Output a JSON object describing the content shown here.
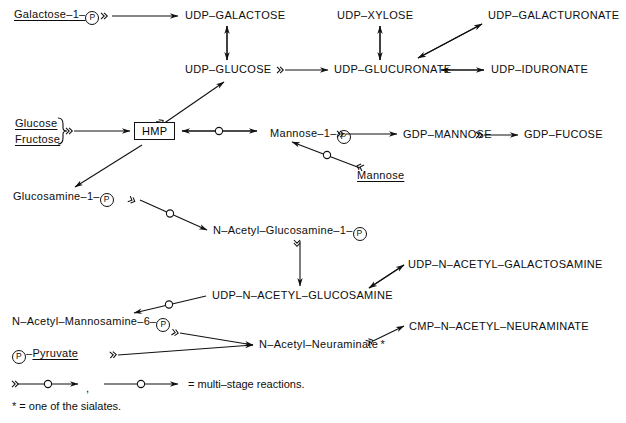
{
  "figure": {
    "type": "biochemical-pathway-diagram"
  },
  "nodes": [
    {
      "id": "galactose-1-p",
      "label": "Galactose–1–",
      "suffix_p": true,
      "underline": true,
      "x": 14,
      "y": 9
    },
    {
      "id": "udp-galactose",
      "label": "UDP–GALACTOSE",
      "suffix_p": false,
      "underline": false,
      "x": 185,
      "y": 10
    },
    {
      "id": "udp-xylose",
      "label": "UDP–XYLOSE",
      "suffix_p": false,
      "underline": false,
      "x": 337,
      "y": 10
    },
    {
      "id": "udp-galacturonate",
      "label": "UDP–GALACTURONATE",
      "suffix_p": false,
      "underline": false,
      "x": 488,
      "y": 10
    },
    {
      "id": "udp-glucose",
      "label": "UDP–GLUCOSE",
      "suffix_p": false,
      "underline": false,
      "x": 185,
      "y": 64
    },
    {
      "id": "udp-glucuronate",
      "label": "UDP–GLUCURONATE",
      "suffix_p": false,
      "underline": false,
      "x": 334,
      "y": 64
    },
    {
      "id": "udp-iduronate",
      "label": "UDP–IDURONATE",
      "suffix_p": false,
      "underline": false,
      "x": 491,
      "y": 64
    },
    {
      "id": "glucose",
      "label": "Glucose",
      "suffix_p": false,
      "underline": true,
      "x": 15,
      "y": 120
    },
    {
      "id": "fructose",
      "label": "Fructose",
      "suffix_p": false,
      "underline": true,
      "x": 15,
      "y": 135
    },
    {
      "id": "mannose-1-p",
      "label": "Mannose–1–",
      "suffix_p": true,
      "underline": false,
      "x": 270,
      "y": 128
    },
    {
      "id": "gdp-mannose",
      "label": "GDP–MANNOSE",
      "suffix_p": false,
      "underline": false,
      "x": 403,
      "y": 129
    },
    {
      "id": "gdp-fucose",
      "label": "GDP–FUCOSE",
      "suffix_p": false,
      "underline": false,
      "x": 524,
      "y": 129
    },
    {
      "id": "mannose",
      "label": "Mannose",
      "suffix_p": false,
      "underline": true,
      "x": 357,
      "y": 170
    },
    {
      "id": "glucosamine-1-p",
      "label": "Glucosamine–1–",
      "suffix_p": true,
      "underline": false,
      "x": 13,
      "y": 191
    },
    {
      "id": "n-acetyl-glucosamine-1-p",
      "label": "N–Acetyl–Glucosamine–1–",
      "suffix_p": true,
      "underline": false,
      "x": 213,
      "y": 225
    },
    {
      "id": "udp-n-acetyl-galactosamine",
      "label": "UDP–N–ACETYL–GALACTOSAMINE",
      "suffix_p": false,
      "underline": false,
      "x": 408,
      "y": 259
    },
    {
      "id": "udp-n-acetyl-glucosamine",
      "label": "UDP–N–ACETYL–GLUCOSAMINE",
      "suffix_p": false,
      "underline": false,
      "x": 212,
      "y": 290
    },
    {
      "id": "n-acetyl-mannosamine-6-p",
      "label": "N–Acetyl–Mannosamine–6–",
      "suffix_p": true,
      "underline": false,
      "x": 12,
      "y": 316
    },
    {
      "id": "cmp-n-acetyl-neuraminate",
      "label": "CMP–N–ACETYL–NEURAMINATE",
      "suffix_p": false,
      "underline": false,
      "x": 409,
      "y": 321
    },
    {
      "id": "n-acetyl-neuraminate",
      "label": "N–Acetyl–Neuraminate *",
      "suffix_p": false,
      "underline": false,
      "x": 259,
      "y": 339
    }
  ],
  "pyruvate": {
    "id": "p-pyruvate",
    "prefix_p": true,
    "dash": "–",
    "label": "Pyruvate",
    "x": 12,
    "y": 348
  },
  "hmp_box": {
    "id": "hmp",
    "label": "HMP",
    "x": 134,
    "y": 125
  },
  "legend": {
    "multi_stage_text": "= multi–stage reactions.",
    "comma": ",",
    "sialate_text": "* = one of the sialates."
  },
  "style": {
    "ink": "#111111",
    "background": "#ffffff",
    "stroke_width": 1.1
  },
  "icons": {
    "phosphate": "P",
    "multi_stage_marker": "circle-on-arrow",
    "double_chevron": "»"
  }
}
